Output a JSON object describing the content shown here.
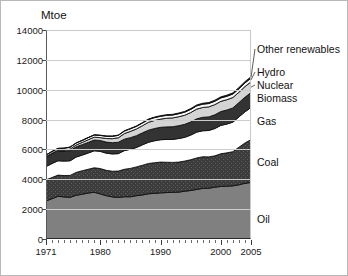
{
  "chart_data": {
    "type": "area",
    "stacked": true,
    "title": "",
    "subtitle": "",
    "unit_label": "Mtoe",
    "xlabel": "",
    "ylabel": "Mtoe",
    "grid": true,
    "legend_position": "right-inline",
    "xlim": [
      1971,
      2005
    ],
    "ylim": [
      0,
      14000
    ],
    "ytick_labels": [
      "0",
      "2000",
      "4000",
      "6000",
      "8000",
      "10000",
      "12000",
      "14000"
    ],
    "ytick_values": [
      0,
      2000,
      4000,
      6000,
      8000,
      10000,
      12000,
      14000
    ],
    "xtick_labels": [
      "1971",
      "1980",
      "1990",
      "2000",
      "2005"
    ],
    "xtick_values": [
      1971,
      1980,
      1990,
      2000,
      2005
    ],
    "x": [
      1971,
      1972,
      1973,
      1974,
      1975,
      1976,
      1977,
      1978,
      1979,
      1980,
      1981,
      1982,
      1983,
      1984,
      1985,
      1986,
      1987,
      1988,
      1989,
      1990,
      1991,
      1992,
      1993,
      1994,
      1995,
      1996,
      1997,
      1998,
      1999,
      2000,
      2001,
      2002,
      2003,
      2004,
      2005
    ],
    "series": [
      {
        "name": "Oil",
        "color": "#808080",
        "texture": "solid",
        "values": [
          2550,
          2700,
          2860,
          2820,
          2790,
          2930,
          3000,
          3080,
          3130,
          3020,
          2900,
          2820,
          2790,
          2830,
          2830,
          2900,
          2950,
          3030,
          3060,
          3090,
          3110,
          3130,
          3140,
          3200,
          3250,
          3320,
          3390,
          3400,
          3470,
          3520,
          3540,
          3560,
          3630,
          3730,
          3790
        ]
      },
      {
        "name": "Coal",
        "color": "#3c3c3c",
        "texture": "dotted",
        "values": [
          1410,
          1420,
          1420,
          1430,
          1470,
          1530,
          1570,
          1590,
          1640,
          1700,
          1700,
          1720,
          1760,
          1840,
          1900,
          1930,
          1990,
          2030,
          2050,
          2060,
          2030,
          2000,
          2010,
          2020,
          2060,
          2110,
          2120,
          2100,
          2100,
          2190,
          2230,
          2290,
          2520,
          2700,
          2870
        ]
      },
      {
        "name": "Gas",
        "color": "#ffffff",
        "texture": "solid",
        "values": [
          890,
          940,
          960,
          970,
          980,
          1030,
          1050,
          1090,
          1140,
          1150,
          1150,
          1160,
          1170,
          1250,
          1280,
          1300,
          1370,
          1420,
          1470,
          1500,
          1530,
          1540,
          1580,
          1590,
          1650,
          1730,
          1740,
          1770,
          1830,
          1900,
          1930,
          1980,
          2030,
          2090,
          2150
        ]
      },
      {
        "name": "Biomass",
        "color": "#333333",
        "texture": "solid",
        "values": [
          640,
          650,
          660,
          670,
          680,
          690,
          700,
          710,
          720,
          730,
          740,
          750,
          760,
          770,
          780,
          790,
          800,
          810,
          820,
          830,
          840,
          850,
          860,
          870,
          880,
          890,
          900,
          910,
          920,
          930,
          940,
          950,
          960,
          980,
          1000
        ]
      },
      {
        "name": "Nuclear",
        "color": "#d4d4d4",
        "texture": "solid",
        "values": [
          29,
          42,
          53,
          68,
          105,
          120,
          150,
          180,
          190,
          190,
          240,
          270,
          300,
          370,
          420,
          450,
          480,
          530,
          540,
          550,
          580,
          590,
          600,
          610,
          630,
          650,
          660,
          670,
          680,
          680,
          690,
          700,
          690,
          710,
          720
        ]
      },
      {
        "name": "Hydro",
        "color": "#f7f7f7",
        "texture": "solid",
        "values": [
          104,
          110,
          112,
          120,
          125,
          128,
          130,
          140,
          145,
          150,
          153,
          157,
          163,
          168,
          172,
          175,
          180,
          182,
          188,
          190,
          192,
          193,
          200,
          205,
          210,
          220,
          222,
          225,
          228,
          230,
          232,
          231,
          235,
          245,
          251
        ]
      },
      {
        "name": "Other renewables",
        "color": "#111111",
        "texture": "solid",
        "values": [
          6,
          7,
          7,
          8,
          9,
          10,
          11,
          12,
          13,
          14,
          16,
          18,
          20,
          22,
          25,
          28,
          31,
          34,
          38,
          42,
          45,
          48,
          51,
          54,
          57,
          60,
          63,
          66,
          69,
          72,
          75,
          78,
          82,
          86,
          90
        ]
      }
    ]
  },
  "axis": {
    "y_unit": "Mtoe"
  }
}
